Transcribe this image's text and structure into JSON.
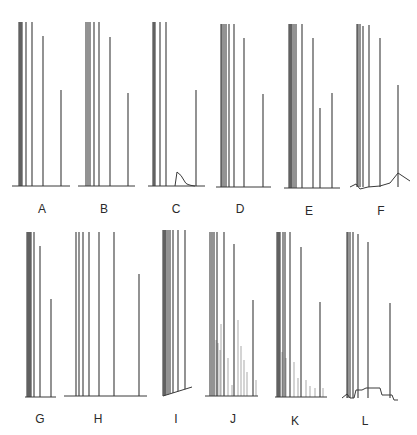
{
  "figure": {
    "line_color": "#3a3a3a",
    "panels": [
      {
        "label": "A",
        "label_x": 42,
        "label_y": 203,
        "baseline_y": 186,
        "x0": 12,
        "x1": 70,
        "peaks": [
          [
            19,
            22
          ],
          [
            20,
            22
          ],
          [
            21,
            22
          ],
          [
            22,
            22
          ],
          [
            26,
            22
          ],
          [
            32,
            22
          ],
          [
            43,
            36
          ],
          [
            61,
            90
          ]
        ]
      },
      {
        "label": "B",
        "label_x": 104,
        "label_y": 203,
        "baseline_y": 186,
        "x0": 78,
        "x1": 135,
        "peaks": [
          [
            86,
            22
          ],
          [
            88,
            22
          ],
          [
            90,
            22
          ],
          [
            94,
            22
          ],
          [
            99,
            22
          ],
          [
            110,
            37
          ],
          [
            128,
            93
          ]
        ]
      },
      {
        "label": "C",
        "label_x": 176,
        "label_y": 203,
        "baseline_y": 186,
        "x0": 148,
        "x1": 205,
        "peaks": [
          [
            153,
            22
          ],
          [
            154,
            22
          ],
          [
            155,
            22
          ],
          [
            160,
            22
          ],
          [
            166,
            22
          ],
          [
            196,
            90
          ]
        ],
        "hump": {
          "x": 177,
          "height": 14,
          "decay": 18
        }
      },
      {
        "label": "D",
        "label_x": 240,
        "label_y": 203,
        "baseline_y": 187,
        "x0": 216,
        "x1": 271,
        "peaks": [
          [
            221,
            24
          ],
          [
            222,
            24
          ],
          [
            224,
            24
          ],
          [
            226,
            24
          ],
          [
            229,
            24
          ],
          [
            234,
            24
          ],
          [
            244,
            38
          ],
          [
            263,
            94
          ]
        ]
      },
      {
        "label": "E",
        "label_x": 309,
        "label_y": 205,
        "baseline_y": 188,
        "x0": 284,
        "x1": 340,
        "peaks": [
          [
            289,
            24
          ],
          [
            290,
            24
          ],
          [
            291,
            24
          ],
          [
            292,
            24
          ],
          [
            294,
            24
          ],
          [
            296,
            24
          ],
          [
            302,
            24
          ],
          [
            313,
            38
          ],
          [
            320,
            108
          ],
          [
            332,
            93
          ]
        ]
      },
      {
        "label": "F",
        "label_x": 381,
        "label_y": 205,
        "baseline_y": 187,
        "x0": 350,
        "x1": 410,
        "peaks": [
          [
            357,
            24
          ],
          [
            358,
            24
          ],
          [
            360,
            24
          ],
          [
            363,
            26
          ],
          [
            369,
            25
          ],
          [
            380,
            38
          ],
          [
            398,
            85
          ]
        ],
        "drift": true
      },
      {
        "label": "G",
        "label_x": 40,
        "label_y": 413,
        "baseline_y": 397,
        "x0": 25,
        "x1": 56,
        "peaks": [
          [
            27,
            232
          ],
          [
            28,
            232
          ],
          [
            29,
            232
          ],
          [
            30,
            232
          ],
          [
            31,
            232
          ],
          [
            34,
            232
          ],
          [
            40,
            246
          ],
          [
            51,
            299
          ]
        ]
      },
      {
        "label": "H",
        "label_x": 98,
        "label_y": 413,
        "baseline_y": 396,
        "x0": 64,
        "x1": 147,
        "peaks": [
          [
            76,
            232
          ],
          [
            79,
            232
          ],
          [
            83,
            232
          ],
          [
            89,
            232
          ],
          [
            99,
            232
          ],
          [
            114,
            232
          ],
          [
            139,
            274
          ]
        ]
      },
      {
        "label": "I",
        "label_x": 176,
        "label_y": 413,
        "baseline_y": 395,
        "x0": 163,
        "x1": 192,
        "peaks": [
          [
            163,
            230
          ],
          [
            164,
            230
          ],
          [
            165,
            230
          ],
          [
            166,
            230
          ],
          [
            168,
            230
          ],
          [
            170,
            230
          ],
          [
            173,
            230
          ],
          [
            178,
            230
          ],
          [
            185,
            230
          ]
        ],
        "slanted_baseline": true
      },
      {
        "label": "J",
        "label_x": 233,
        "label_y": 413,
        "baseline_y": 396,
        "x0": 205,
        "x1": 258,
        "peaks": [
          [
            210,
            232
          ],
          [
            212,
            232
          ],
          [
            214,
            232
          ],
          [
            217,
            232
          ],
          [
            224,
            232
          ],
          [
            234,
            244
          ],
          [
            253,
            300
          ]
        ],
        "minor": [
          [
            216,
            340
          ],
          [
            218,
            343
          ],
          [
            220,
            350
          ],
          [
            221,
            324
          ],
          [
            228,
            358
          ],
          [
            232,
            385
          ],
          [
            238,
            320
          ],
          [
            241,
            346
          ],
          [
            244,
            360
          ],
          [
            247,
            372
          ],
          [
            256,
            380
          ]
        ]
      },
      {
        "label": "K",
        "label_x": 295,
        "label_y": 415,
        "baseline_y": 397,
        "x0": 275,
        "x1": 327,
        "peaks": [
          [
            277,
            232
          ],
          [
            278,
            232
          ],
          [
            279,
            232
          ],
          [
            280,
            232
          ],
          [
            283,
            232
          ],
          [
            285,
            232
          ],
          [
            290,
            232
          ],
          [
            301,
            247
          ],
          [
            320,
            302
          ]
        ],
        "minor": [
          [
            282,
            352
          ],
          [
            286,
            358
          ],
          [
            294,
            362
          ],
          [
            298,
            378
          ],
          [
            306,
            380
          ],
          [
            310,
            386
          ],
          [
            315,
            388
          ],
          [
            323,
            388
          ]
        ]
      },
      {
        "label": "L",
        "label_x": 365,
        "label_y": 415,
        "baseline_y": 398,
        "x0": 342,
        "x1": 398,
        "peaks": [
          [
            347,
            232
          ],
          [
            348,
            232
          ],
          [
            350,
            232
          ],
          [
            353,
            232
          ],
          [
            358,
            234
          ],
          [
            368,
            242
          ],
          [
            390,
            303
          ]
        ],
        "plateau": true
      }
    ]
  }
}
